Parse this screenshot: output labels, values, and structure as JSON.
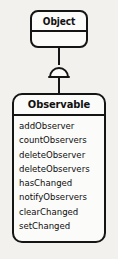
{
  "diagram": {
    "type": "uml-class-diagram",
    "background_color": "#f2f1ee",
    "line_color": "#151515",
    "box_fill_color": "#fbfbfa",
    "text_color": "#101010",
    "classes": [
      {
        "id": "object",
        "name": "Object",
        "compartments": [
          "title",
          "empty"
        ],
        "members": []
      },
      {
        "id": "observable",
        "name": "Observable",
        "compartments": [
          "title",
          "operations"
        ],
        "members": [
          "addObserver",
          "countObservers",
          "deleteObserver",
          "deleteObservers",
          "hasChanged",
          "notifyObservers",
          "clearChanged",
          "setChanged"
        ]
      }
    ],
    "relationship": {
      "kind": "generalization",
      "marker": "semicircle-arrowhead",
      "from": "Observable",
      "to": "Object"
    }
  }
}
